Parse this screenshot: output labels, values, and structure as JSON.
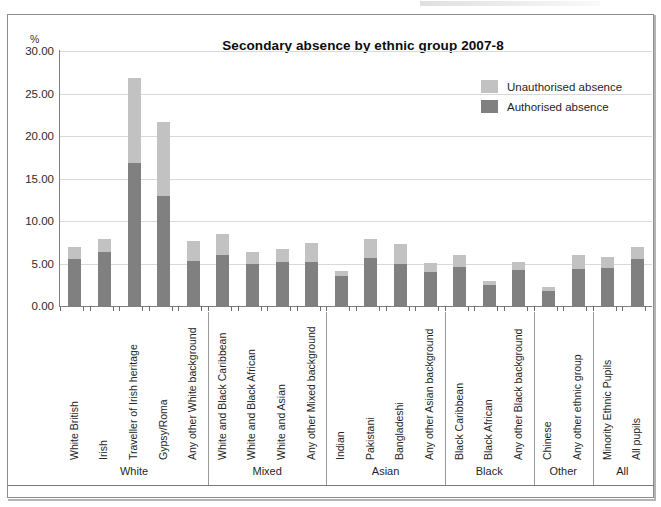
{
  "figure": {
    "title": "Secondary absence by ethnic group 2007-8",
    "y_unit": "%"
  },
  "legend": {
    "items": [
      {
        "label": "Unauthorised absence",
        "color": "#c2c2c2"
      },
      {
        "label": "Authorised absence",
        "color": "#808080"
      }
    ]
  },
  "axis": {
    "yticks": [
      "30.00",
      "25.00",
      "20.00",
      "15.00",
      "10.00",
      "5.00",
      "0.00"
    ]
  },
  "groups": [
    {
      "label": "White",
      "count": 5
    },
    {
      "label": "Mixed",
      "count": 4
    },
    {
      "label": "Asian",
      "count": 4
    },
    {
      "label": "Black",
      "count": 3
    },
    {
      "label": "Other",
      "count": 2
    },
    {
      "label": "All",
      "count": 2
    }
  ],
  "chart_data": {
    "type": "bar",
    "subtype": "stacked",
    "title": "Secondary absence by ethnic group 2007-8",
    "xlabel": "",
    "ylabel": "%",
    "ylim": [
      0,
      30
    ],
    "ytick_step": 5,
    "grid": true,
    "legend_position": "top-right",
    "categories": [
      "White British",
      "Irish",
      "Traveller of Irish heritage",
      "Gypsy/Roma",
      "Any other White background",
      "White and Black Caribbean",
      "White and Black African",
      "White and Asian",
      "Any other Mixed background",
      "Indian",
      "Pakistani",
      "Bangladeshi",
      "Any other Asian background",
      "Black Caribbean",
      "Black African",
      "Any other Black background",
      "Chinese",
      "Any other ethnic group",
      "Minority Ethnic Pupils",
      "All pupils"
    ],
    "series": [
      {
        "name": "Authorised absence",
        "color": "#808080",
        "values": [
          5.5,
          6.4,
          16.8,
          12.9,
          5.3,
          6.0,
          4.9,
          5.2,
          5.2,
          3.5,
          5.7,
          4.9,
          4.0,
          4.6,
          2.5,
          4.2,
          1.8,
          4.4,
          4.5,
          5.5
        ]
      },
      {
        "name": "Unauthorised absence",
        "color": "#c2c2c2",
        "values": [
          1.5,
          1.5,
          10.0,
          8.8,
          2.3,
          2.5,
          1.4,
          1.5,
          2.2,
          0.6,
          2.2,
          2.4,
          1.1,
          1.4,
          0.5,
          1.0,
          0.4,
          1.6,
          1.3,
          1.4
        ]
      }
    ],
    "totals": [
      7.0,
      7.9,
      26.8,
      21.7,
      7.6,
      8.5,
      6.3,
      6.7,
      7.4,
      4.1,
      7.9,
      7.3,
      5.1,
      6.0,
      3.0,
      5.2,
      2.2,
      6.0,
      5.8,
      6.9
    ]
  }
}
